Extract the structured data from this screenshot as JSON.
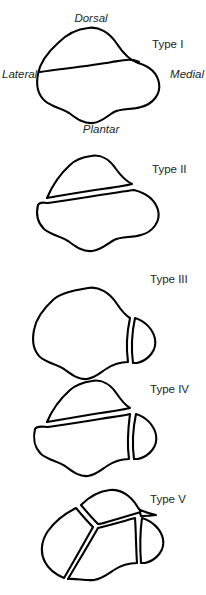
{
  "figure": {
    "background_color": "#ffffff",
    "line_color": "#000000",
    "text_color": "#231f20"
  },
  "orientation_labels": {
    "dorsal": "Dorsal",
    "plantar": "Plantar",
    "lateral": "Lateral",
    "medial": "Medial"
  },
  "panels": [
    {
      "id": "type-1",
      "label": "Type I",
      "description": "Bean-shaped navicular outline with a single oblique dorsal fracture line; no displacement.",
      "fragment_count": 2,
      "has_orientation_labels": true
    },
    {
      "id": "type-2",
      "label": "Type II",
      "description": "Oblique dorsal fracture with a displaced dorsal fragment separated by a gap.",
      "fragment_count": 2,
      "has_orientation_labels": false
    },
    {
      "id": "type-3",
      "label": "Type III",
      "description": "Vertical fracture separating a medial fragment from the body.",
      "fragment_count": 2,
      "has_orientation_labels": false
    },
    {
      "id": "type-4",
      "label": "Type IV",
      "description": "Combined oblique dorsal fracture and vertical medial fracture.",
      "fragment_count": 3,
      "has_orientation_labels": false
    },
    {
      "id": "type-5",
      "label": "Type V",
      "description": "Comminuted fracture with multiple lines converging at a central point, producing four fragments.",
      "fragment_count": 4,
      "has_orientation_labels": false
    }
  ]
}
